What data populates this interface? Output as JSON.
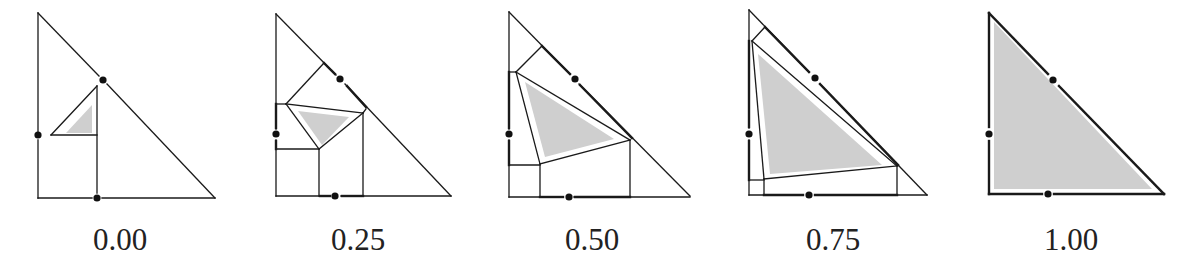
{
  "figure": {
    "panels": [
      {
        "label": "0.00",
        "t": 0.0
      },
      {
        "label": "0.25",
        "t": 0.25
      },
      {
        "label": "0.50",
        "t": 0.5
      },
      {
        "label": "0.75",
        "t": 0.75
      },
      {
        "label": "1.00",
        "t": 1.0
      }
    ],
    "colors": {
      "stroke": "#1a1a1a",
      "shade": "#cfcfcf",
      "dot": "#111111"
    }
  }
}
